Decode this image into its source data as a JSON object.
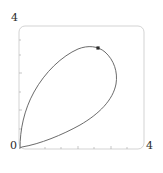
{
  "plot": {
    "frame": {
      "x0": 19,
      "y0": 26,
      "x1": 144,
      "y1": 149,
      "corner_radius": 6,
      "stroke": "#c8c8c8",
      "stroke_width": 0.8
    },
    "labels": {
      "y_max": "4",
      "origin": "0",
      "x_max": "4"
    },
    "ticks": {
      "x_major": [
        78,
        111
      ],
      "x_minor": [
        45,
        61,
        94,
        127
      ],
      "y_major": [
        110,
        73
      ],
      "y_minor": [
        129,
        92,
        55,
        40
      ],
      "tick_len_major": 3,
      "tick_len_minor": 2,
      "stroke": "#b0b0b0"
    },
    "curve": {
      "stroke": "#5a5a5a",
      "stroke_width": 0.9,
      "fill": "none",
      "path": "M 20,148 C 20,130 24,110 34,92 C 45,72 62,56 78,49 C 88,45 98,46 105,52 C 114,60 118,72 116,84 C 113,100 99,114 80,125 C 62,135 40,144 22,147 C 21,147.4 20.3,147.7 20,148 Z"
    },
    "marker": {
      "x": 98,
      "y": 48,
      "size": 3.2,
      "shape": "square",
      "fill": "#2b2b2b"
    }
  },
  "chart_data": {
    "type": "line",
    "title": "",
    "xlabel": "",
    "ylabel": "",
    "xlim": [
      0,
      4
    ],
    "ylim": [
      0,
      4
    ],
    "grid": false,
    "legend": null,
    "x_tick_labels": [
      "0",
      "4"
    ],
    "y_tick_labels": [
      "0",
      "4"
    ],
    "series": [
      {
        "name": "parametric-loop",
        "description": "closed teardrop loop starting and ending at origin",
        "x": [
          0.0,
          0.12,
          0.3,
          0.48,
          0.75,
          1.05,
          1.4,
          1.7,
          1.95,
          2.2,
          2.45,
          2.7,
          2.9,
          3.05,
          3.12,
          3.1,
          3.0,
          2.8,
          2.5,
          2.15,
          1.8,
          1.45,
          1.1,
          0.8,
          0.5,
          0.25,
          0.08,
          0.0
        ],
        "y": [
          0.0,
          0.4,
          0.78,
          1.1,
          1.48,
          1.85,
          2.25,
          2.6,
          2.85,
          3.05,
          3.2,
          3.28,
          3.28,
          3.18,
          3.0,
          2.78,
          2.55,
          2.25,
          1.92,
          1.6,
          1.32,
          1.05,
          0.8,
          0.58,
          0.38,
          0.2,
          0.07,
          0.0
        ]
      }
    ],
    "points": [
      {
        "name": "marked-point",
        "x": 2.55,
        "y": 3.28
      }
    ]
  }
}
